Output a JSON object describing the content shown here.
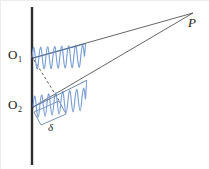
{
  "figure": {
    "background_color": "#ffffff",
    "width": 209,
    "height": 169
  },
  "colors": {
    "barrier": "#2f2f2f",
    "ray": "#4a4a4a",
    "wave": "#7a9fd4",
    "wave_axis": "#4a6fa5",
    "dashed": "#3a3a3a",
    "bracket": "#5577aa",
    "label": "#232323",
    "frame": "#ededed"
  },
  "labels": {
    "source_upper": "O",
    "source_upper_sub": "1",
    "source_lower": "O",
    "source_lower_sub": "2",
    "point_p": "P",
    "path_difference": "δ"
  },
  "geometry": {
    "barrier": {
      "x": 32,
      "y_top": 7,
      "y_bottom": 165,
      "stroke_width": 2.4
    },
    "source_upper": {
      "x": 32,
      "y": 59
    },
    "source_lower": {
      "x": 32,
      "y": 108
    },
    "point_p": {
      "x": 194,
      "y": 12
    },
    "ray_upper": {
      "x1": 33,
      "y1": 58,
      "x2": 193,
      "y2": 13
    },
    "ray_lower": {
      "x1": 33,
      "y1": 107,
      "x2": 193,
      "y2": 13
    },
    "dashed_normal": {
      "x1": 34,
      "y1": 60,
      "x2": 59,
      "y2": 101
    },
    "wave_upper": {
      "x_start": 32,
      "y_start": 58,
      "x_end": 86,
      "y_end": 43,
      "cycles": 6,
      "amplitude": 11
    },
    "wave_lower": {
      "x_start": 33,
      "y_start": 107,
      "x_end": 87,
      "y_end": 80,
      "cycles": 6,
      "amplitude": 11
    },
    "delta_bracket": {
      "p1": {
        "x": 34,
        "y": 112
      },
      "p2": {
        "x": 59,
        "y": 101
      },
      "p3": {
        "x": 66,
        "y": 114
      },
      "p4": {
        "x": 41,
        "y": 125
      }
    }
  }
}
